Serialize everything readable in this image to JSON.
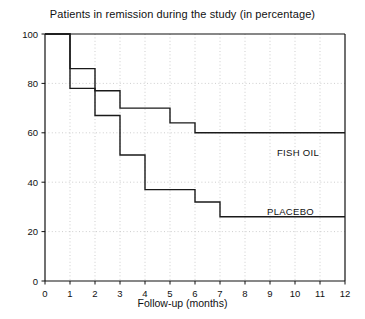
{
  "chart_data": {
    "type": "line",
    "title": "Patients in remission during the study (in percentage)",
    "xlabel": "Follow-up (months)",
    "ylabel": "",
    "xlim": [
      0,
      12
    ],
    "ylim": [
      0,
      100
    ],
    "xticks": [
      0,
      1,
      2,
      3,
      4,
      5,
      6,
      7,
      8,
      9,
      10,
      11,
      12
    ],
    "yticks": [
      0,
      20,
      40,
      60,
      80,
      100
    ],
    "grid": true,
    "grid_style": "dotted",
    "legend_position": "inline-right",
    "line_color": "#1a1a1a",
    "step_type": "post",
    "series": [
      {
        "name": "FISH OIL",
        "label_x": 10.4,
        "label_y": 52,
        "x": [
          0,
          1,
          2,
          3,
          4,
          5,
          6,
          7,
          8,
          9,
          10,
          11,
          12
        ],
        "values": [
          100,
          86,
          86,
          77,
          70,
          70,
          60,
          60,
          60,
          60,
          60,
          60,
          60
        ],
        "steps": [
          {
            "from_month": 0,
            "to_month": 1,
            "value": 100
          },
          {
            "from_month": 1,
            "to_month": 2,
            "value": 86
          },
          {
            "from_month": 2,
            "to_month": 3,
            "value": 77
          },
          {
            "from_month": 3,
            "to_month": 5,
            "value": 70
          },
          {
            "from_month": 5,
            "to_month": 6,
            "value": 64
          },
          {
            "from_month": 6,
            "to_month": 12,
            "value": 60
          }
        ]
      },
      {
        "name": "PLACEBO",
        "label_x": 10.0,
        "label_y": 28,
        "x": [
          0,
          1,
          2,
          3,
          4,
          5,
          6,
          7,
          8,
          9,
          10,
          11,
          12
        ],
        "values": [
          100,
          78,
          67,
          51,
          37,
          37,
          32,
          26,
          26,
          26,
          26,
          26,
          26
        ],
        "steps": [
          {
            "from_month": 0,
            "to_month": 1,
            "value": 100
          },
          {
            "from_month": 1,
            "to_month": 2,
            "value": 78
          },
          {
            "from_month": 2,
            "to_month": 3,
            "value": 67
          },
          {
            "from_month": 3,
            "to_month": 4,
            "value": 51
          },
          {
            "from_month": 4,
            "to_month": 6,
            "value": 37
          },
          {
            "from_month": 6,
            "to_month": 7,
            "value": 32
          },
          {
            "from_month": 7,
            "to_month": 12,
            "value": 26
          }
        ]
      }
    ]
  },
  "axis": {
    "ytick_labels": [
      "0",
      "20",
      "40",
      "60",
      "80",
      "100"
    ],
    "xtick_labels": [
      "0",
      "1",
      "2",
      "3",
      "4",
      "5",
      "6",
      "7",
      "8",
      "9",
      "10",
      "11",
      "12"
    ]
  },
  "labels": {
    "fish_oil": "FISH OIL",
    "placebo": "PLACEBO"
  }
}
